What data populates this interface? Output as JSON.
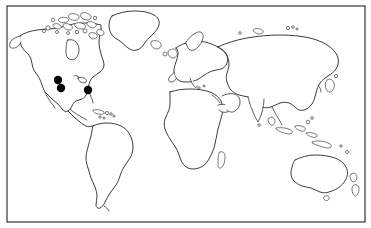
{
  "figure": {
    "type": "distribution-map",
    "projection": "equirectangular",
    "title": "",
    "caption": "",
    "background_color": "#ffffff",
    "outline_color": "#1a1a1a",
    "marker_color": "#000000",
    "frame": {
      "x": 7,
      "y": 6,
      "width": 358,
      "height": 216,
      "stroke_color": "#2b2b2b"
    }
  },
  "map": {
    "landmass_labels": [
      "North America",
      "Greenland",
      "South America",
      "Europe",
      "Africa",
      "Asia",
      "Australia",
      "New Zealand",
      "Madagascar",
      "Iceland",
      "British Isles",
      "Japan",
      "Canadian Arctic Archipelago"
    ],
    "shows_graticule": false,
    "shows_country_borders": false,
    "shows_labels": false,
    "shows_legend": false,
    "shows_scale_bar": false
  },
  "occurrence_points": {
    "count": 3,
    "marker_shape": "filled-circle",
    "marker_radius_px": 4,
    "points": [
      {
        "id": "point-1",
        "region": "southwestern-north-america",
        "x": 58,
        "y": 80,
        "approx_lon": -118,
        "approx_lat": 35
      },
      {
        "id": "point-2",
        "region": "southwestern-north-america",
        "x": 61,
        "y": 88,
        "approx_lon": -115,
        "approx_lat": 29
      },
      {
        "id": "point-3",
        "region": "southeastern-north-america",
        "x": 88,
        "y": 90,
        "approx_lon": -82,
        "approx_lat": 28
      }
    ]
  }
}
